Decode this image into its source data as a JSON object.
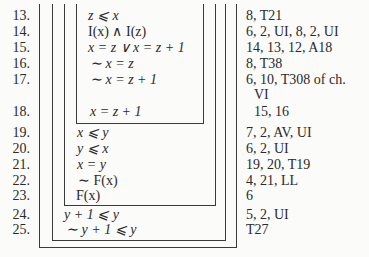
{
  "proof": {
    "lines": [
      {
        "num": "13.",
        "formula": "z ⩽ x",
        "justification": "8, T21"
      },
      {
        "num": "14.",
        "formula": "I(x) ∧ I(z)",
        "justification": "6, 2, UI, 8, 2, UI"
      },
      {
        "num": "15.",
        "formula": "x = z ∨ x = z + 1",
        "justification": "14, 13, 12, A18"
      },
      {
        "num": "16.",
        "formula": "∼ x = z",
        "justification": "8, T38"
      },
      {
        "num": "17.",
        "formula": "∼ x = z + 1",
        "justification": "6, 10, T308 of ch."
      },
      {
        "num": "",
        "formula": "",
        "justification": "VI"
      },
      {
        "num": "18.",
        "formula": "x = z + 1",
        "justification": "15, 16"
      },
      {
        "num": "19.",
        "formula": "x ⩽ y",
        "justification": "7, 2, AV, UI"
      },
      {
        "num": "20.",
        "formula": "y ⩽ x",
        "justification": "6, 2, UI"
      },
      {
        "num": "21.",
        "formula": "x = y",
        "justification": "19, 20, T19"
      },
      {
        "num": "22.",
        "formula": "∼ F(x)",
        "justification": "4, 21, LL"
      },
      {
        "num": "23.",
        "formula": "F(x)",
        "justification": "6"
      },
      {
        "num": "24.",
        "formula": "y + 1 ⩽ y",
        "justification": "5, 2, UI"
      },
      {
        "num": "25.",
        "formula": "∼ y + 1 ⩽ y",
        "justification": "T27"
      }
    ]
  },
  "colors": {
    "ink": "#2a2a2a",
    "rule": "#3a3a3a",
    "paper": "#fbfbfa"
  }
}
